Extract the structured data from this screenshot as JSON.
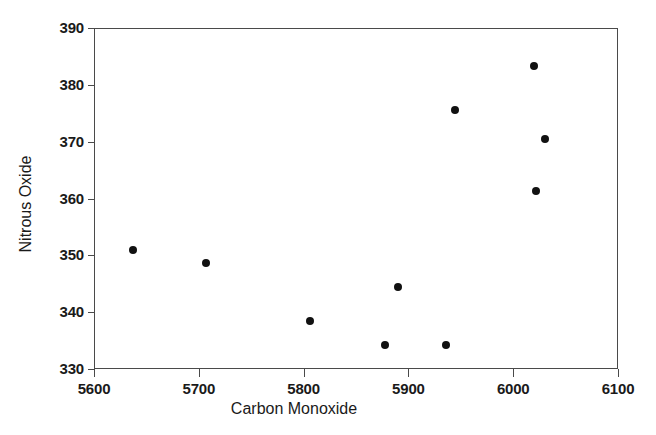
{
  "chart_data": {
    "type": "scatter",
    "title": "",
    "xlabel": "Carbon Monoxide",
    "ylabel": "Nitrous Oxide",
    "xlim": [
      5600,
      6100
    ],
    "ylim": [
      330,
      390
    ],
    "x_ticks": [
      5600,
      5700,
      5800,
      5900,
      6000,
      6100
    ],
    "y_ticks": [
      330,
      340,
      350,
      360,
      370,
      380,
      390
    ],
    "grid": false,
    "legend": false,
    "marker": {
      "shape": "circle",
      "color": "#111111",
      "size_px": 8
    },
    "axis_color": "#4a4a4a",
    "background": "#ffffff",
    "points": [
      {
        "x": 5637,
        "y": 351.0
      },
      {
        "x": 5707,
        "y": 348.6
      },
      {
        "x": 5806,
        "y": 338.4
      },
      {
        "x": 5878,
        "y": 334.3
      },
      {
        "x": 5890,
        "y": 344.4
      },
      {
        "x": 5936,
        "y": 334.3
      },
      {
        "x": 5944,
        "y": 375.6
      },
      {
        "x": 6020,
        "y": 383.4
      },
      {
        "x": 6022,
        "y": 361.3
      },
      {
        "x": 6030,
        "y": 370.4
      }
    ]
  }
}
